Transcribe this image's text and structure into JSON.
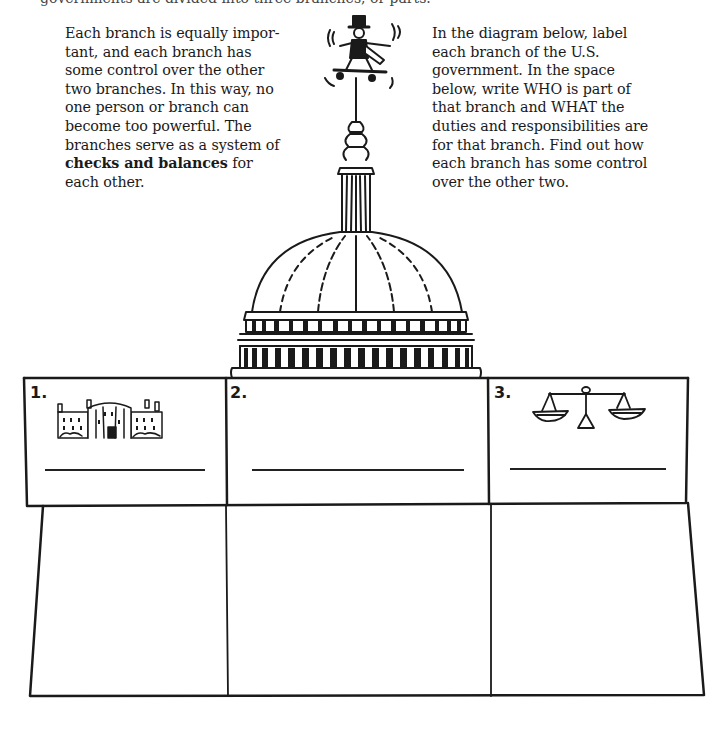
{
  "header_fragment": "governments are divided into three branches, or parts.",
  "intro": {
    "left_text_before_bold": "Each branch is equally impor­tant, and each branch has some control over the other two branches. In this way, no one person or branch can become too powerful. The branches serve as a system of ",
    "left_text_bold": "checks and balances",
    "left_text_after_bold": " for each other.",
    "right_text": "In the diagram below, label each branch of the U.S. government. In the space below, write WHO is part of that branch and WHAT the duties and responsibilities are for that branch. Find out how each branch has some control over the other two."
  },
  "illustration": {
    "subject": "U.S. Capitol dome with Uncle Sam skateboarding weathervane",
    "icons": [
      "uncle-sam-skateboard-icon",
      "capitol-dome-icon"
    ]
  },
  "branches": [
    {
      "number": "1.",
      "icon": "white-house-icon",
      "label_value": "",
      "notes_value": ""
    },
    {
      "number": "2.",
      "icon": "",
      "label_value": "",
      "notes_value": ""
    },
    {
      "number": "3.",
      "icon": "scales-of-justice-icon",
      "label_value": "",
      "notes_value": ""
    }
  ],
  "colors": {
    "ink": "#1a1a1a",
    "paper": "#ffffff"
  }
}
